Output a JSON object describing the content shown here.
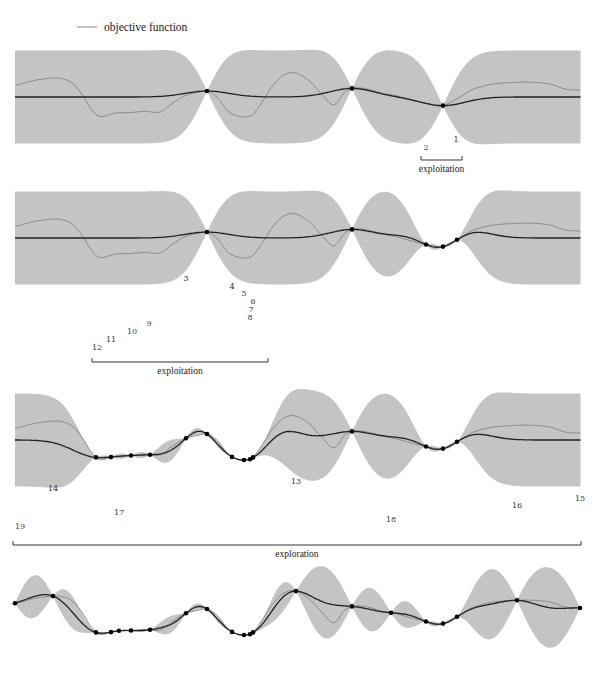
{
  "legend": {
    "label": "objective function",
    "line_color": "#888888"
  },
  "colors": {
    "band": "#c4c4c4",
    "mean": "#222222",
    "objective": "#8a8a8a",
    "point": "#000000",
    "text": "#333333"
  },
  "chart_data": {
    "type": "line",
    "xlabel": "",
    "ylabel": "",
    "x_px_range": [
      15,
      581
    ],
    "objective_function": [
      [
        15,
        0.45
      ],
      [
        30,
        0.6
      ],
      [
        45,
        0.7
      ],
      [
        60,
        0.72
      ],
      [
        72,
        0.55
      ],
      [
        82,
        0.1
      ],
      [
        92,
        -0.5
      ],
      [
        100,
        -0.75
      ],
      [
        115,
        -0.62
      ],
      [
        130,
        -0.6
      ],
      [
        145,
        -0.55
      ],
      [
        160,
        -0.58
      ],
      [
        172,
        -0.25
      ],
      [
        185,
        0.05
      ],
      [
        198,
        0.18
      ],
      [
        208,
        0.22
      ],
      [
        218,
        -0.05
      ],
      [
        228,
        -0.55
      ],
      [
        240,
        -0.75
      ],
      [
        252,
        -0.7
      ],
      [
        262,
        -0.2
      ],
      [
        272,
        0.4
      ],
      [
        284,
        0.85
      ],
      [
        296,
        0.92
      ],
      [
        310,
        0.6
      ],
      [
        322,
        0.1
      ],
      [
        334,
        -0.3
      ],
      [
        345,
        0.2
      ],
      [
        355,
        0.35
      ],
      [
        368,
        0.3
      ],
      [
        382,
        0.15
      ],
      [
        396,
        0.05
      ],
      [
        410,
        -0.1
      ],
      [
        426,
        -0.25
      ],
      [
        442,
        -0.34
      ],
      [
        458,
        -0.05
      ],
      [
        472,
        0.28
      ],
      [
        490,
        0.48
      ],
      [
        510,
        0.55
      ],
      [
        530,
        0.57
      ],
      [
        550,
        0.5
      ],
      [
        566,
        0.3
      ],
      [
        581,
        0.27
      ]
    ],
    "panels": [
      {
        "id": 1,
        "observations_x": [
          207,
          352,
          443
        ],
        "annotation_numbers": [
          {
            "n": "1",
            "x": 456,
            "y": 142
          },
          {
            "n": "2",
            "x": 426,
            "y": 150
          }
        ],
        "bracket": {
          "label": "exploitation",
          "x1": 421,
          "x2": 462,
          "y": 160
        }
      },
      {
        "id": 2,
        "observations_x": [
          207,
          352,
          426,
          443,
          457
        ],
        "annotation_numbers": [
          {
            "n": "3",
            "x": 186,
            "y": 281
          },
          {
            "n": "4",
            "x": 232,
            "y": 289
          },
          {
            "n": "5",
            "x": 244,
            "y": 296
          },
          {
            "n": "6",
            "x": 253,
            "y": 304
          },
          {
            "n": "7",
            "x": 251,
            "y": 312
          },
          {
            "n": "8",
            "x": 250,
            "y": 320
          },
          {
            "n": "9",
            "x": 149,
            "y": 326
          },
          {
            "n": "10",
            "x": 132,
            "y": 334
          },
          {
            "n": "11",
            "x": 111,
            "y": 342
          },
          {
            "n": "12",
            "x": 97,
            "y": 350
          }
        ],
        "bracket": {
          "label": "exploitation",
          "x1": 92,
          "x2": 268,
          "y": 362
        }
      },
      {
        "id": 3,
        "observations_x": [
          96,
          111,
          131,
          150,
          186,
          207,
          232,
          244,
          250,
          253,
          352,
          426,
          443,
          457
        ],
        "annotation_numbers": [
          {
            "n": "13",
            "x": 296,
            "y": 484
          },
          {
            "n": "14",
            "x": 53,
            "y": 491
          },
          {
            "n": "15",
            "x": 580,
            "y": 501
          },
          {
            "n": "16",
            "x": 517,
            "y": 508
          },
          {
            "n": "17",
            "x": 119,
            "y": 515
          },
          {
            "n": "18",
            "x": 391,
            "y": 522
          },
          {
            "n": "19",
            "x": 20,
            "y": 529
          }
        ],
        "bracket": {
          "label": "exploration",
          "x1": 13,
          "x2": 581,
          "y": 545
        }
      },
      {
        "id": 4,
        "observations_x": [
          15,
          53,
          96,
          111,
          119,
          131,
          150,
          186,
          207,
          232,
          244,
          250,
          253,
          296,
          352,
          391,
          426,
          443,
          457,
          517,
          580
        ],
        "annotation_numbers": [],
        "bracket": null
      }
    ]
  }
}
